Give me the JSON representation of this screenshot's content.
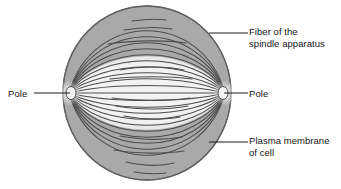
{
  "figure": {
    "top_cropped_text": "",
    "colors": {
      "cytoplasm_outer": "#a9a9a9",
      "spindle_inner": "#efefef",
      "fiber_line": "#4a4a4a",
      "membrane_outline": "#5a5a5a",
      "leader_line": "#1a1a1a",
      "text": "#141414",
      "background": "#ffffff"
    }
  },
  "labels": {
    "fiber": {
      "line1": "Fiber of the",
      "line2": "spindle apparatus"
    },
    "membrane": {
      "line1": "Plasma membrane",
      "line2": "of cell"
    },
    "pole_left": "Pole",
    "pole_right": "Pole"
  },
  "diagram": {
    "cell": {
      "center_x": 147,
      "center_y": 93,
      "radius_x": 84,
      "radius_y": 87
    },
    "poles": {
      "left_x": 69,
      "right_x": 225,
      "y": 93
    },
    "fiber_count": 22,
    "spindle_region": {
      "half_height": 27
    }
  }
}
